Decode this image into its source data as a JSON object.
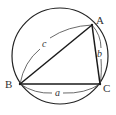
{
  "diagram": {
    "circle": {
      "cx": 60,
      "cy": 56,
      "r": 48
    },
    "vertices": [
      {
        "name": "A",
        "x": 92,
        "y": 25,
        "label_x": 96,
        "label_y": 24
      },
      {
        "name": "B",
        "x": 20,
        "y": 84,
        "label_x": 5,
        "label_y": 88
      },
      {
        "name": "C",
        "x": 100,
        "y": 84,
        "label_x": 103,
        "label_y": 92
      }
    ],
    "sides": [
      {
        "name": "a",
        "from": "B",
        "to": "C",
        "label": "a",
        "label_x": 57,
        "label_y": 96
      },
      {
        "name": "b",
        "from": "C",
        "to": "A",
        "label": "b",
        "label_x": 98,
        "label_y": 56
      },
      {
        "name": "c",
        "from": "A",
        "to": "B",
        "label": "c",
        "label_x": 44,
        "label_y": 47
      }
    ],
    "colors": {
      "stroke": "#1a1a1a",
      "brace": "#444444",
      "text": "#333333",
      "background": "#ffffff"
    }
  }
}
